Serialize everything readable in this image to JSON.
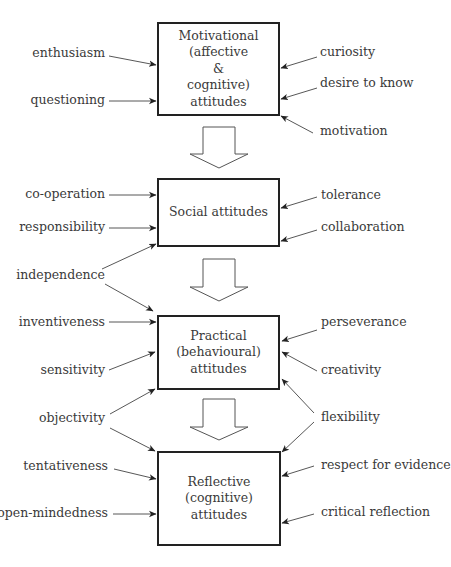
{
  "diagram": {
    "type": "flow",
    "colors": {
      "line": "#333333",
      "box_border": "#222222",
      "text": "#3a3a3a",
      "background": "#ffffff"
    },
    "boxes": [
      {
        "id": "motivational",
        "lines": [
          "Motivational",
          "(affective",
          "&",
          "cognitive)",
          "attitudes"
        ]
      },
      {
        "id": "social",
        "lines": [
          "Social attitudes"
        ]
      },
      {
        "id": "practical",
        "lines": [
          "Practical",
          "(behavioural)",
          "attitudes"
        ]
      },
      {
        "id": "reflective",
        "lines": [
          "Reflective",
          "(cognitive)",
          "attitudes"
        ]
      }
    ],
    "flow_arrows": [
      {
        "from": "motivational",
        "to": "social"
      },
      {
        "from": "social",
        "to": "practical"
      },
      {
        "from": "practical",
        "to": "reflective"
      }
    ],
    "inputs_left": [
      {
        "label": "enthusiasm",
        "targets": [
          "motivational"
        ]
      },
      {
        "label": "questioning",
        "targets": [
          "motivational"
        ]
      },
      {
        "label": "co-operation",
        "targets": [
          "social"
        ]
      },
      {
        "label": "responsibility",
        "targets": [
          "social"
        ]
      },
      {
        "label": "independence",
        "targets": [
          "social",
          "practical"
        ]
      },
      {
        "label": "inventiveness",
        "targets": [
          "practical"
        ]
      },
      {
        "label": "sensitivity",
        "targets": [
          "practical"
        ]
      },
      {
        "label": "objectivity",
        "targets": [
          "practical",
          "reflective"
        ]
      },
      {
        "label": "tentativeness",
        "targets": [
          "reflective"
        ]
      },
      {
        "label": "open-mindedness",
        "targets": [
          "reflective"
        ]
      }
    ],
    "inputs_right": [
      {
        "label": "curiosity",
        "targets": [
          "motivational"
        ]
      },
      {
        "label": "desire to know",
        "targets": [
          "motivational"
        ]
      },
      {
        "label": "motivation",
        "targets": [
          "motivational"
        ]
      },
      {
        "label": "tolerance",
        "targets": [
          "social"
        ]
      },
      {
        "label": "collaboration",
        "targets": [
          "social"
        ]
      },
      {
        "label": "perseverance",
        "targets": [
          "practical"
        ]
      },
      {
        "label": "creativity",
        "targets": [
          "practical"
        ]
      },
      {
        "label": "flexibility",
        "targets": [
          "practical",
          "reflective"
        ]
      },
      {
        "label": "respect for evidence",
        "targets": [
          "reflective"
        ]
      },
      {
        "label": "critical reflection",
        "targets": [
          "reflective"
        ]
      }
    ]
  }
}
